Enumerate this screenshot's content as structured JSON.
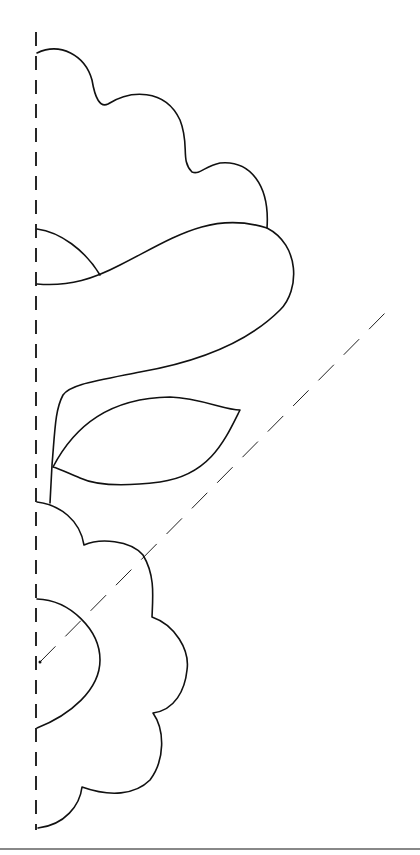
{
  "drawing": {
    "title": "Scalloped flower and leaf cut-out template",
    "colors": {
      "line": "#111111",
      "background": "#ffffff",
      "rule": "#888888"
    },
    "fold_line": {
      "x": 36,
      "y1": 32,
      "y2": 830
    },
    "diagonal_guide": {
      "x1": 40,
      "y1": 662,
      "x2": 388,
      "y2": 310
    },
    "shapes": {
      "top_cloud": "M37 53 C60 42 85 55 92 80 C95 98 100 108 108 104 C130 90 165 88 180 120 C190 145 180 160 192 172 C200 175 205 166 220 163 C250 160 270 185 267 228",
      "small_half_circle": "M37 229 C60 232 85 250 100 275",
      "wave_band": "M37 284 C70 287 95 278 120 265 C170 240 210 210 267 228 C300 245 300 290 280 310 C240 350 180 365 140 372 C90 382 70 385 63 395 C55 410 55 430 52 465 L50 503",
      "leaf": "M53 467 C75 425 110 398 170 397 C200 398 225 410 240 410 C225 440 210 475 160 482 C120 487 95 485 80 478 C70 474 60 469 53 467",
      "flower": "M37 502 C60 505 80 520 84 545 C100 538 130 540 143 555 C155 575 153 595 152 617 C175 625 190 650 187 670 C185 690 175 710 153 713 C165 730 165 760 150 780 C135 795 110 797 82 787 C80 805 65 825 38 828",
      "center_half_circle": "M37 599 C70 600 100 630 100 660 C100 690 70 715 37 728"
    },
    "center_dot": {
      "cx": 40,
      "cy": 662
    }
  }
}
